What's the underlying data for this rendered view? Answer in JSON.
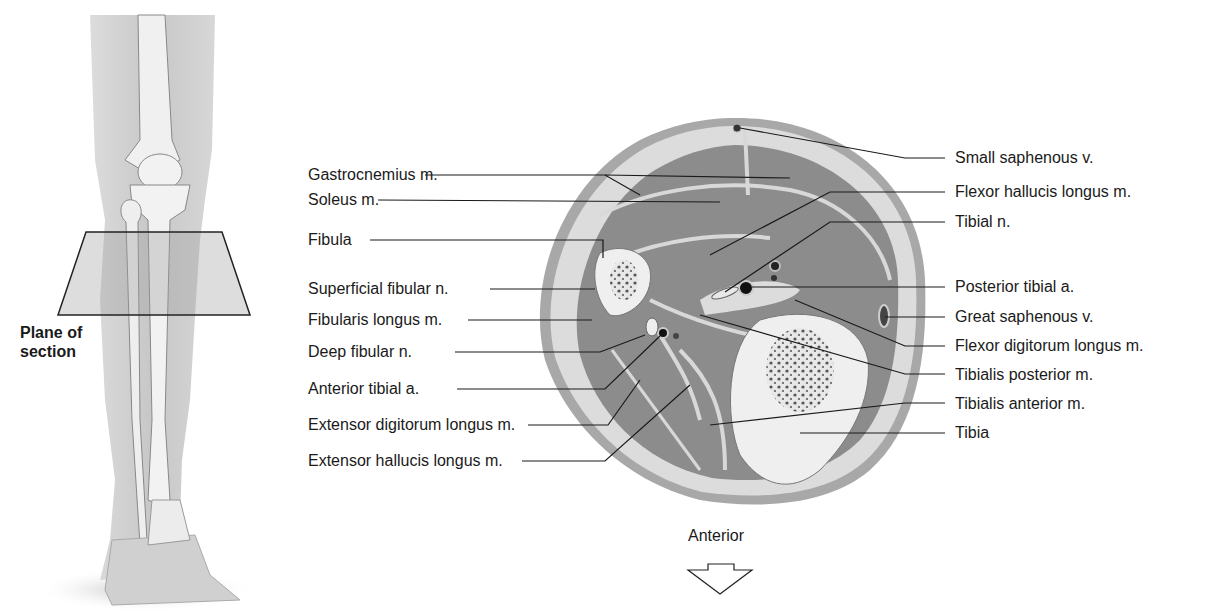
{
  "leg_figure": {
    "plane_label_line1": "Plane of",
    "plane_label_line2": "section"
  },
  "left_labels": [
    {
      "text": "Gastrocnemius m.",
      "x": 308,
      "y": 175
    },
    {
      "text": "Soleus m.",
      "x": 308,
      "y": 200
    },
    {
      "text": "Fibula",
      "x": 308,
      "y": 240
    },
    {
      "text": "Superficial fibular n.",
      "x": 308,
      "y": 289
    },
    {
      "text": "Fibularis longus m.",
      "x": 308,
      "y": 320
    },
    {
      "text": "Deep fibular n.",
      "x": 308,
      "y": 352
    },
    {
      "text": "Anterior tibial a.",
      "x": 308,
      "y": 389
    },
    {
      "text": "Extensor digitorum longus m.",
      "x": 308,
      "y": 425
    },
    {
      "text": "Extensor hallucis longus m.",
      "x": 308,
      "y": 461
    }
  ],
  "right_labels": [
    {
      "text": "Small saphenous v.",
      "x": 955,
      "y": 175
    },
    {
      "text": "Flexor hallucis longus m.",
      "x": 955,
      "y": 190
    },
    {
      "text": "Tibial n.",
      "x": 955,
      "y": 221
    },
    {
      "text": "Posterior tibial a.",
      "x": 955,
      "y": 285
    },
    {
      "text": "Great saphenous v.",
      "x": 955,
      "y": 315
    },
    {
      "text": "Flexor digitorum longus m.",
      "x": 955,
      "y": 345
    },
    {
      "text": "Tibialis posterior m.",
      "x": 955,
      "y": 374
    },
    {
      "text": "Tibialis anterior m.",
      "x": 955,
      "y": 403
    },
    {
      "text": "Tibia",
      "x": 955,
      "y": 432
    }
  ],
  "orientation": {
    "label": "Anterior",
    "arrow_icon": "down-arrow-outline"
  },
  "colors": {
    "muscle": "#8e8e8e",
    "fat": "#d9d9d9",
    "bone": "#ececec",
    "skin": "#b0b0b0",
    "leader_line": "#1a1a1a"
  }
}
